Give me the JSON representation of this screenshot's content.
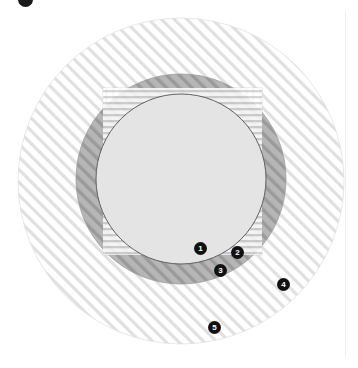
{
  "figure": {
    "name": "nested-set-venn-diagram",
    "background_color": "#ffffff",
    "width": 358,
    "height": 368
  },
  "corner_badge": {
    "icon": "filled-circle-badge-icon",
    "label": ""
  },
  "layers": [
    {
      "id": "outer-hatched-circle",
      "shape": "circle",
      "fill_pattern": "diagonal-hatch",
      "pattern_angle_deg": 45,
      "stroke_color": "#d2d2d2",
      "fill_color": "#fbfbfb",
      "cx": 181,
      "cy": 181,
      "r": 163
    },
    {
      "id": "vertical-striped-square",
      "shape": "rect",
      "fill_pattern": "vertical-stripes",
      "stroke_color": "#d8d8d8",
      "fill_color": "#fafafa",
      "x": 103,
      "y": 88,
      "width": 159,
      "height": 167
    },
    {
      "id": "gray-hatched-circle",
      "shape": "circle",
      "fill_pattern": "diagonal-hatch",
      "pattern_angle_deg": 45,
      "stroke_color": "#9a9a9a",
      "fill_color": "#b3b3b3",
      "cx": 181,
      "cy": 179,
      "r": 105
    },
    {
      "id": "horizontal-striped-circle",
      "shape": "circle",
      "fill_pattern": "horizontal-stripes",
      "stroke_color": "#bdbdbd",
      "fill_color": "#f4f4f4",
      "cx": 181,
      "cy": 179,
      "r": 85
    },
    {
      "id": "inner-solid-circle",
      "shape": "circle",
      "fill_pattern": "solid",
      "stroke_color": "#555555",
      "fill_color": "#e3e3e3",
      "cx": 181,
      "cy": 179,
      "r": 85
    }
  ],
  "markers": [
    {
      "label": "1",
      "x": 200,
      "y": 248
    },
    {
      "label": "2",
      "x": 237,
      "y": 252
    },
    {
      "label": "3",
      "x": 220,
      "y": 270
    },
    {
      "label": "4",
      "x": 283,
      "y": 284
    },
    {
      "label": "5",
      "x": 214,
      "y": 327
    }
  ],
  "colors": {
    "marker_fill": "#111111",
    "marker_text": "#ffffff",
    "hatch_light": "#d7d7d7",
    "hatch_dark": "#8f8f8f",
    "inner_fill": "#e3e3e3",
    "gray_band_fill": "#b3b3b3"
  }
}
